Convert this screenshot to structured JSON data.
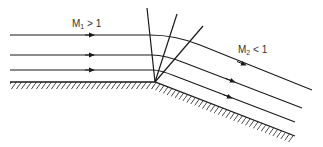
{
  "figure": {
    "regions": {
      "upstream": {
        "symbol": "M",
        "subscript": "1",
        "relation": "> 1"
      },
      "downstream": {
        "symbol": "M",
        "subscript": "2",
        "relation": "< 1"
      }
    },
    "colors": {
      "stroke": "#1a1a1a",
      "text": "#333333",
      "background": "#ffffff"
    }
  }
}
